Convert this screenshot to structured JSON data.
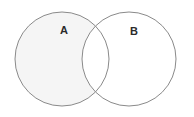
{
  "figure": {
    "type": "venn-diagram",
    "width": 194,
    "height": 117,
    "background_color": "#ffffff"
  },
  "style": {
    "stroke_color": "#8a8a8a",
    "stroke_width": 1,
    "shaded_fill_color": "#f5f5f5",
    "unshaded_fill_color": "#ffffff",
    "label_color": "#2b2b2b",
    "label_font_size": 11
  },
  "sets": [
    {
      "id": "set-a",
      "label": "A",
      "cx": 62,
      "cy": 59,
      "r": 47,
      "filled": true,
      "fill_color": "#f5f5f5",
      "label_x": 64,
      "label_y": 31
    },
    {
      "id": "set-b",
      "label": "B",
      "cx": 129,
      "cy": 59,
      "r": 47,
      "filled": false,
      "fill_color": "#ffffff",
      "label_x": 134,
      "label_y": 32
    }
  ],
  "regions": [
    {
      "id": "region-a-only",
      "name": "A only",
      "shaded": true,
      "fill_color": "#f5f5f5"
    },
    {
      "id": "region-intersection",
      "name": "A intersect B",
      "shaded": false,
      "fill_color": "#ffffff"
    },
    {
      "id": "region-b-only",
      "name": "B only",
      "shaded": false,
      "fill_color": "#ffffff"
    }
  ]
}
